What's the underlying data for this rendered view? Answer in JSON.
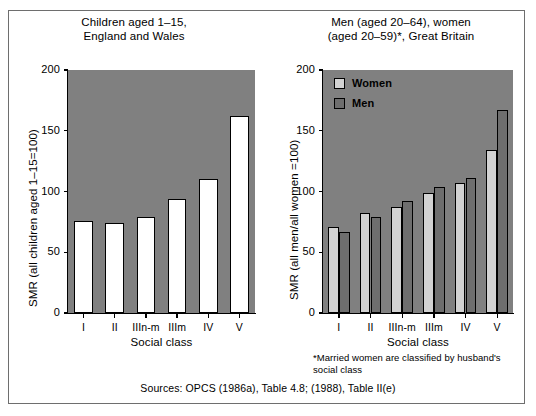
{
  "figure": {
    "source_note": "Sources: OPCS (1986a), Table 4.8; (1988), Table II(e)",
    "footnote": "*Married women are classified by husband's social class",
    "background_color": "#ffffff",
    "plot_background_color": "#808080",
    "frame_color": "#6e6e6e"
  },
  "chart_data": [
    {
      "id": "children",
      "type": "bar",
      "title": "Children aged 1–15,\nEngland and Wales",
      "xlabel": "Social class",
      "ylabel": "SMR (all children aged 1–15=100)",
      "categories": [
        "I",
        "II",
        "IIIn-m",
        "IIIm",
        "IV",
        "V"
      ],
      "values": [
        76,
        74,
        79,
        94,
        110,
        162
      ],
      "series": [
        {
          "name": "Children",
          "color": "#ffffff",
          "values": [
            76,
            74,
            79,
            94,
            110,
            162
          ]
        }
      ],
      "ylim": [
        0,
        200
      ],
      "yticks": [
        0,
        50,
        100,
        150,
        200
      ],
      "grid": false,
      "legend": false
    },
    {
      "id": "adults",
      "type": "bar",
      "title": "Men (aged 20–64), women\n(aged 20–59)*, Great Britain",
      "xlabel": "Social class",
      "ylabel": "SMR (all men/all women =100)",
      "categories": [
        "I",
        "II",
        "IIIn-m",
        "IIIm",
        "IV",
        "V"
      ],
      "series": [
        {
          "name": "Women",
          "color": "#d2d2d2",
          "values": [
            71,
            82,
            87,
            99,
            107,
            134
          ]
        },
        {
          "name": "Men",
          "color": "#6e6e6e",
          "values": [
            67,
            79,
            92,
            104,
            111,
            167
          ]
        }
      ],
      "ylim": [
        0,
        200
      ],
      "yticks": [
        0,
        50,
        100,
        150,
        200
      ],
      "grid": false,
      "legend": true,
      "legend_position": "top-left"
    }
  ]
}
